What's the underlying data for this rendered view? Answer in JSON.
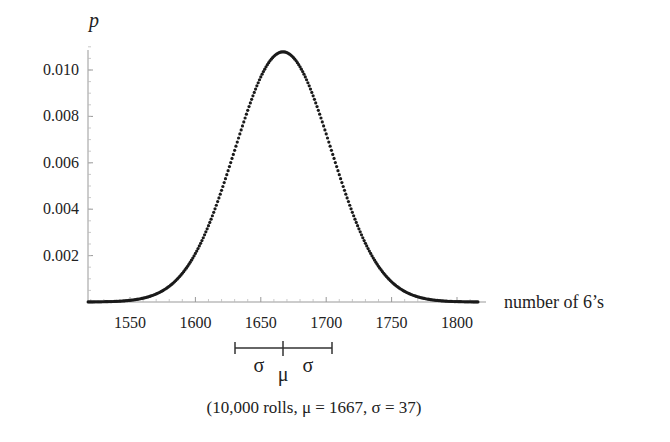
{
  "chart_data": {
    "type": "scatter",
    "title": "",
    "xlabel": "number of 6's",
    "ylabel": "p",
    "xlim": [
      1518,
      1816
    ],
    "ylim": [
      0,
      0.0112
    ],
    "x_ticks": [
      1550,
      1600,
      1650,
      1700,
      1750,
      1800
    ],
    "x_tick_labels": [
      "1550",
      "1600",
      "1650",
      "1700",
      "1750",
      "1800"
    ],
    "y_ticks": [
      0.002,
      0.004,
      0.006,
      0.008,
      0.01
    ],
    "y_tick_labels": [
      "0.002",
      "0.004",
      "0.006",
      "0.008",
      "0.010"
    ],
    "grid": false,
    "legend": null,
    "distribution": {
      "n": 10000,
      "mean": 1667,
      "sigma": 37,
      "peak_p": 0.01078
    },
    "series": [
      {
        "name": "p(number of 6's)",
        "x": [
          1520,
          1530,
          1540,
          1550,
          1560,
          1570,
          1580,
          1590,
          1600,
          1610,
          1620,
          1630,
          1640,
          1650,
          1660,
          1667,
          1670,
          1680,
          1690,
          1700,
          1710,
          1720,
          1730,
          1740,
          1750,
          1760,
          1770,
          1780,
          1790,
          1800,
          1810
        ],
        "values": [
          0.0,
          0.0,
          0.0,
          0.0,
          0.0,
          0.0,
          0.0001,
          0.0001,
          0.0002,
          0.0004,
          0.0021,
          0.0039,
          0.0063,
          0.0087,
          0.0105,
          0.0108,
          0.0107,
          0.01,
          0.0089,
          0.0073,
          0.0055,
          0.0039,
          0.0025,
          0.0016,
          0.0009,
          0.0004,
          0.0002,
          0.0001,
          0.0,
          0.0,
          0.0
        ]
      }
    ],
    "annotations": {
      "sigma_bar": {
        "left_label": "σ",
        "center_label": "μ",
        "right_label": "σ",
        "from": 1630,
        "center": 1667,
        "to": 1704
      },
      "caption": "(10,000 rolls, μ = 1667, σ = 37)"
    }
  },
  "labels": {
    "ylabel": "p",
    "xlabel": "number of 6’s",
    "sigma_left": "σ",
    "sigma_right": "σ",
    "mu": "μ",
    "caption": "(10,000 rolls, μ = 1667, σ = 37)"
  }
}
